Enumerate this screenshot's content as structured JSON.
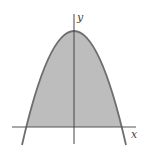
{
  "figure": {
    "axes": {
      "x_label": "x",
      "y_label": "y"
    },
    "curve": {
      "type": "parabola",
      "opens": "down",
      "vertex_on": "y-axis",
      "symmetric_about": "y-axis"
    },
    "shaded_region": "between parabola and x-axis",
    "colors": {
      "fill": "#bdbdbd",
      "curve": "#6e6e6e",
      "axis": "#444444",
      "background": "#ffffff"
    }
  }
}
